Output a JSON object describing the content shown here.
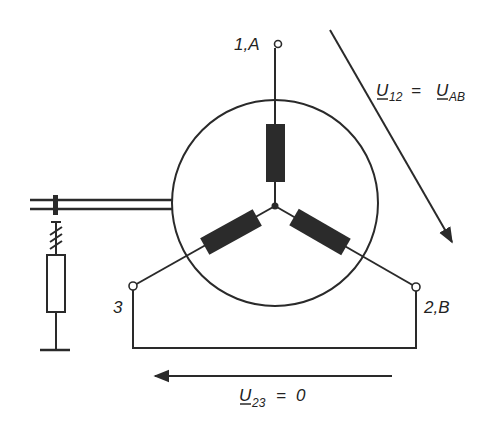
{
  "diagram": {
    "type": "three-phase star (wye) winding with terminals",
    "terminals": [
      {
        "id": "1A",
        "label": "1,A"
      },
      {
        "id": "2B",
        "label": "2,B"
      },
      {
        "id": "3",
        "label": "3"
      }
    ],
    "voltages": [
      {
        "id": "u12",
        "symbol": "U",
        "subscript": "12",
        "equals": "=",
        "rhs_symbol": "U",
        "rhs_subscript": "AB"
      },
      {
        "id": "u23",
        "symbol": "U",
        "subscript": "23",
        "equals": "=",
        "rhs_value": "0"
      }
    ],
    "colors": {
      "line": "#2a2a2a",
      "winding_fill": "#2b2b2b",
      "background": "#ffffff"
    }
  }
}
